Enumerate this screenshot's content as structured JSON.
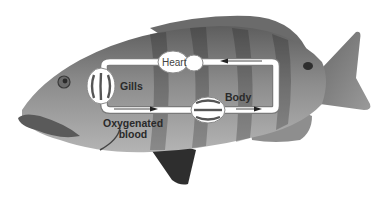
{
  "diagram": {
    "type": "fish single-loop circulatory system overlaid on fish photograph",
    "labels": {
      "heart": "Heart",
      "gills": "Gills",
      "body": "Body",
      "oxygenated_line1": "Oxygenated",
      "oxygenated_line2": "blood"
    },
    "flow": [
      {
        "from": "Heart",
        "to": "Gills",
        "direction": "left along top vessel"
      },
      {
        "from": "Gills",
        "to": "Body",
        "direction": "right along bottom vessel",
        "note": "Oxygenated blood"
      },
      {
        "from": "Body",
        "to": "Heart",
        "direction": "up right side then left along top vessel"
      }
    ],
    "colors": {
      "vessel": "#ffffff",
      "vessel_outline": "#7a7a7a",
      "fish_body": "#8a8a8a",
      "fish_dark": "#3a3a3a",
      "label_text": "#2a2a2a"
    }
  }
}
